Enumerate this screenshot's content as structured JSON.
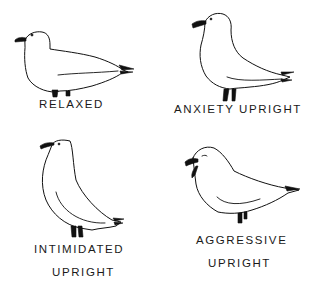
{
  "diagram": {
    "title": "",
    "panels": [
      {
        "id": "relaxed",
        "label_lines": [
          "RELAXED"
        ]
      },
      {
        "id": "anxiety-upright",
        "label_lines": [
          "ANXIETY UPRIGHT"
        ]
      },
      {
        "id": "intimidated-upright",
        "label_lines": [
          "INTIMIDATED",
          "UPRIGHT"
        ]
      },
      {
        "id": "aggressive-upright",
        "label_lines": [
          "AGGRESSIVE",
          "UPRIGHT"
        ]
      }
    ]
  },
  "colors": {
    "ink": "#111111",
    "background": "#ffffff"
  }
}
